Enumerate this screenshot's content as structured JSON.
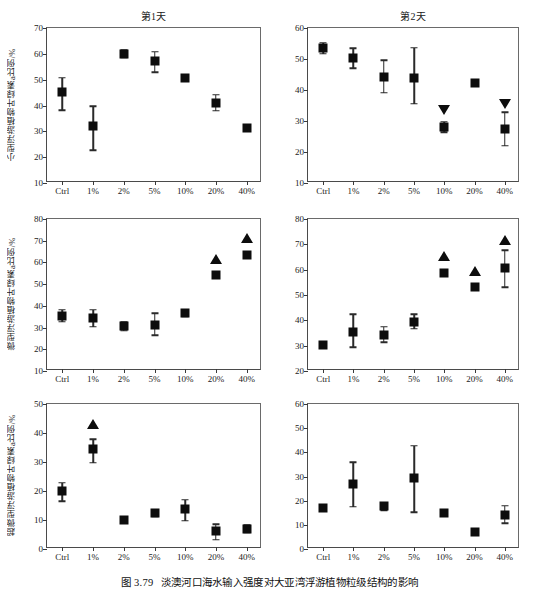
{
  "figure": {
    "caption_number": "图 3.79",
    "caption_text": "淡澳河口海水输入强度对大亚湾浮游植物粒级结构的影响"
  },
  "columns": [
    {
      "key": "day1",
      "title": "第1天"
    },
    {
      "key": "day2",
      "title": "第2天"
    }
  ],
  "rows": [
    {
      "key": "micro",
      "ylabel": "小型浮游植物叶绿素a比例/%"
    },
    {
      "key": "nano",
      "ylabel": "微型浮游植物叶绿素a比例/%"
    },
    {
      "key": "pico",
      "ylabel": "超微型浮游植物叶绿素a比例/%"
    }
  ],
  "categories": [
    "Ctrl",
    "1%",
    "2%",
    "5%",
    "10%",
    "20%",
    "40%"
  ],
  "chart_data": [
    {
      "id": "micro-day1",
      "type": "scatter",
      "title": "第1天",
      "xlabel": "",
      "ylabel": "小型浮游植物叶绿素a比例/%",
      "categories": [
        "Ctrl",
        "1%",
        "2%",
        "5%",
        "10%",
        "20%",
        "40%"
      ],
      "values": [
        45.2,
        32.0,
        60.0,
        57.2,
        50.8,
        41.1,
        31.2
      ],
      "err_low": [
        7.0,
        9.3,
        1.3,
        4.3,
        0.8,
        3.2,
        0.0
      ],
      "err_high": [
        5.5,
        7.8,
        1.3,
        3.6,
        0.8,
        3.0,
        0.0
      ],
      "ylim": [
        10,
        70
      ],
      "yticks": [
        10,
        20,
        30,
        40,
        50,
        60,
        70
      ],
      "grid": false,
      "annotations": []
    },
    {
      "id": "micro-day2",
      "type": "scatter",
      "title": "第2天",
      "xlabel": "",
      "ylabel": "",
      "categories": [
        "Ctrl",
        "1%",
        "2%",
        "5%",
        "10%",
        "20%",
        "40%"
      ],
      "values": [
        53.5,
        50.3,
        44.3,
        43.9,
        28.2,
        42.2,
        27.4
      ],
      "err_low": [
        1.8,
        3.3,
        5.2,
        8.3,
        1.9,
        0.0,
        5.4
      ],
      "err_high": [
        1.8,
        3.2,
        5.3,
        9.8,
        1.6,
        0.0,
        5.5
      ],
      "ylim": [
        10,
        60
      ],
      "yticks": [
        10,
        20,
        30,
        40,
        50,
        60
      ],
      "grid": false,
      "annotations": [
        {
          "category": "10%",
          "marker": "triangle-down",
          "value": 33.5
        },
        {
          "category": "40%",
          "marker": "triangle-down",
          "value": 35.6
        }
      ]
    },
    {
      "id": "nano-day1",
      "type": "scatter",
      "title": "第1天",
      "xlabel": "",
      "ylabel": "微型浮游植物叶绿素a比例/%",
      "categories": [
        "Ctrl",
        "1%",
        "2%",
        "5%",
        "10%",
        "20%",
        "40%"
      ],
      "values": [
        35.3,
        34.6,
        30.7,
        31.4,
        36.7,
        54.3,
        63.4
      ],
      "err_low": [
        2.6,
        4.3,
        2.2,
        5.0,
        1.4,
        0.0,
        0.0
      ],
      "err_high": [
        2.9,
        3.6,
        2.0,
        5.3,
        1.4,
        0.0,
        0.0
      ],
      "ylim": [
        10,
        80
      ],
      "yticks": [
        10,
        20,
        30,
        40,
        50,
        60,
        70,
        80
      ],
      "grid": false,
      "annotations": [
        {
          "category": "20%",
          "marker": "triangle-up",
          "value": 61.5
        },
        {
          "category": "40%",
          "marker": "triangle-up",
          "value": 71.3
        }
      ]
    },
    {
      "id": "nano-day2",
      "type": "scatter",
      "title": "第2天",
      "xlabel": "",
      "ylabel": "",
      "categories": [
        "Ctrl",
        "1%",
        "2%",
        "5%",
        "10%",
        "20%",
        "40%"
      ],
      "values": [
        30.4,
        35.2,
        34.1,
        39.5,
        58.6,
        53.1,
        60.7
      ],
      "err_low": [
        0.0,
        5.9,
        2.7,
        2.9,
        0.0,
        0.0,
        7.7
      ],
      "err_high": [
        0.0,
        7.2,
        3.4,
        3.0,
        0.0,
        0.0,
        6.9
      ],
      "ylim": [
        20,
        80
      ],
      "yticks": [
        20,
        30,
        40,
        50,
        60,
        70,
        80
      ],
      "grid": false,
      "annotations": [
        {
          "category": "10%",
          "marker": "triangle-up",
          "value": 65.2
        },
        {
          "category": "20%",
          "marker": "triangle-up",
          "value": 59.6
        },
        {
          "category": "40%",
          "marker": "triangle-up",
          "value": 71.8
        }
      ]
    },
    {
      "id": "pico-day1",
      "type": "scatter",
      "title": "第1天",
      "xlabel": "",
      "ylabel": "超微型浮游植物叶绿素a比例/%",
      "categories": [
        "Ctrl",
        "1%",
        "2%",
        "5%",
        "10%",
        "20%",
        "40%"
      ],
      "values": [
        20.0,
        34.5,
        10.0,
        12.3,
        13.7,
        6.2,
        7.0
      ],
      "err_low": [
        3.5,
        4.8,
        0.8,
        1.2,
        4.0,
        3.0,
        1.2
      ],
      "err_high": [
        2.8,
        3.4,
        0.8,
        1.2,
        3.2,
        2.3,
        1.2
      ],
      "ylim": [
        0,
        50
      ],
      "yticks": [
        0,
        10,
        20,
        30,
        40,
        50
      ],
      "grid": false,
      "annotations": [
        {
          "category": "1%",
          "marker": "triangle-up",
          "value": 43.0
        }
      ]
    },
    {
      "id": "pico-day2",
      "type": "scatter",
      "title": "第2天",
      "xlabel": "",
      "ylabel": "",
      "categories": [
        "Ctrl",
        "1%",
        "2%",
        "5%",
        "10%",
        "20%",
        "40%"
      ],
      "values": [
        17.0,
        26.8,
        17.6,
        29.2,
        15.0,
        7.0,
        14.0
      ],
      "err_low": [
        0.0,
        9.3,
        1.6,
        14.0,
        0.0,
        0.0,
        3.4
      ],
      "err_high": [
        0.0,
        9.0,
        1.5,
        13.6,
        0.0,
        0.0,
        3.8
      ],
      "ylim": [
        0,
        60
      ],
      "yticks": [
        0,
        10,
        20,
        30,
        40,
        50,
        60
      ],
      "grid": false,
      "annotations": []
    }
  ]
}
